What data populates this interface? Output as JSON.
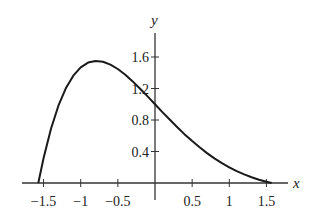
{
  "chart_data": {
    "type": "line",
    "title": "",
    "xlabel": "x",
    "ylabel": "y",
    "xlim": [
      -1.8,
      1.8
    ],
    "ylim": [
      0,
      1.9
    ],
    "grid": false,
    "legend": null,
    "x_ticks": [
      -1.5,
      -1,
      -0.5,
      0,
      0.5,
      1,
      1.5
    ],
    "x_tick_labels": [
      "−1.5",
      "−1",
      "−0.5",
      "",
      "0.5",
      "1",
      "1.5"
    ],
    "y_ticks": [
      0.4,
      0.8,
      1.2,
      1.6
    ],
    "y_tick_labels": [
      "0.4",
      "0.8",
      "1.2",
      "1.6"
    ],
    "series": [
      {
        "name": "y = e^(-x) cos x",
        "x": [
          -1.5708,
          -1.5,
          -1.4,
          -1.3,
          -1.2,
          -1.1,
          -1.0,
          -0.9,
          -0.8,
          -0.7,
          -0.6,
          -0.5,
          -0.4,
          -0.3,
          -0.2,
          -0.1,
          0.0,
          0.1,
          0.2,
          0.3,
          0.4,
          0.5,
          0.6,
          0.7,
          0.8,
          0.9,
          1.0,
          1.1,
          1.2,
          1.3,
          1.4,
          1.5,
          1.5708
        ],
        "y": [
          0.0,
          0.317,
          0.689,
          0.981,
          1.203,
          1.363,
          1.469,
          1.529,
          1.55,
          1.54,
          1.504,
          1.447,
          1.374,
          1.29,
          1.197,
          1.1,
          1.0,
          0.9,
          0.802,
          0.708,
          0.617,
          0.532,
          0.453,
          0.38,
          0.313,
          0.253,
          0.199,
          0.151,
          0.109,
          0.073,
          0.042,
          0.016,
          0.0
        ]
      }
    ]
  },
  "plot": {
    "origin_px": [
      155,
      183
    ],
    "x_scale_px_per_unit": 74.3,
    "y_scale_px_per_unit": 78.75,
    "x_axis_px": [
      22,
      288
    ],
    "y_axis_px": [
      33,
      200
    ],
    "line_color": "#1a1a1a",
    "axis_color": "#333333"
  }
}
